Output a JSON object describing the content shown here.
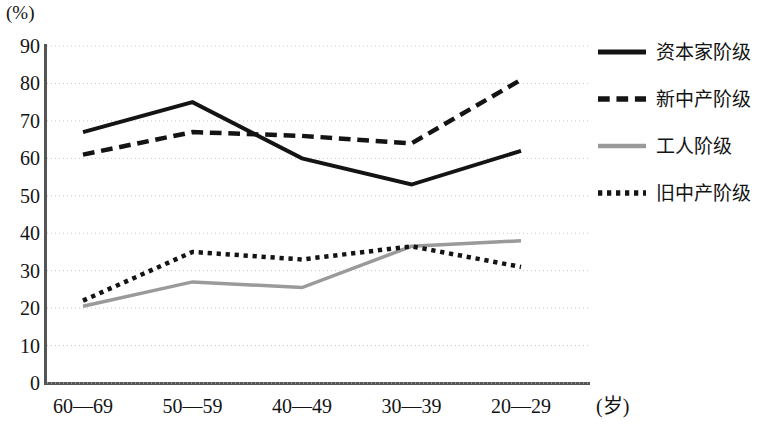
{
  "chart_data": {
    "type": "line",
    "title": "",
    "subtitle": "",
    "xlabel": "(岁)",
    "ylabel": "(%)",
    "categories": [
      "60—69",
      "50—59",
      "40—49",
      "30—39",
      "20—29"
    ],
    "ylim": [
      0,
      90
    ],
    "y_ticks": [
      90,
      80,
      70,
      60,
      50,
      40,
      30,
      20,
      10,
      0
    ],
    "grid": true,
    "grid_style": "dotted-horizontal",
    "legend_position": "right",
    "series": [
      {
        "name": "资本家阶级",
        "style": "solid",
        "color": "#141414",
        "width": 4,
        "values": [
          67,
          75,
          60,
          53,
          62
        ]
      },
      {
        "name": "新中产阶级",
        "style": "dashed",
        "color": "#141414",
        "width": 4.5,
        "values": [
          61,
          67,
          66,
          64,
          81
        ]
      },
      {
        "name": "工人阶级",
        "style": "solid",
        "color": "#9a9a9a",
        "width": 3.5,
        "values": [
          20.5,
          27,
          25.5,
          36.5,
          38
        ]
      },
      {
        "name": "旧中产阶级",
        "style": "dotted",
        "color": "#141414",
        "width": 4.5,
        "values": [
          22,
          35,
          33,
          36.5,
          31
        ]
      }
    ]
  },
  "axes": {
    "y_unit_label": "(%)",
    "x_unit_label": "(岁)"
  },
  "legend": {
    "items": [
      {
        "label": "资本家阶级",
        "swatch": "solid-line-swatch"
      },
      {
        "label": "新中产阶级",
        "swatch": "dashed-line-swatch"
      },
      {
        "label": "工人阶级",
        "swatch": "solid-gray-line-swatch"
      },
      {
        "label": "旧中产阶级",
        "swatch": "dotted-line-swatch"
      }
    ]
  }
}
